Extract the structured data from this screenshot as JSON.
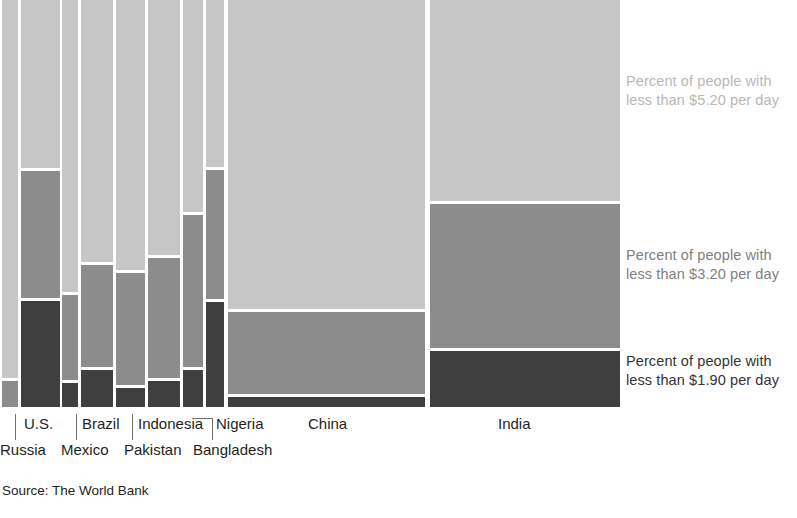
{
  "figure": {
    "source_note": "Source: The World Bank",
    "background_color": "#ffffff"
  },
  "legend": {
    "position": "right",
    "entries": [
      {
        "key": "under_5_20",
        "color": "#c6c6c6",
        "text_color": "#b8b8b8",
        "line1": "Percent of people with",
        "line2": "less than $5.20 per day"
      },
      {
        "key": "under_3_20",
        "color": "#8c8c8c",
        "text_color": "#808080",
        "line1": "Percent of people with",
        "line2": "less than $3.20 per day"
      },
      {
        "key": "under_1_90",
        "color": "#3f3f3f",
        "text_color": "#333333",
        "line1": "Percent of people with",
        "line2": "less than $1.90 per day"
      }
    ]
  },
  "chart_data": {
    "type": "bar",
    "subtype": "marimekko-mosaic",
    "title": "",
    "subtitle": "",
    "xlabel": "",
    "ylabel": "",
    "grid": false,
    "legend_position": "right",
    "note": "Column width is proportional to population; stacked segment heights are cumulative percent of population below each poverty line.",
    "categories": [
      "Russia",
      "U.S.",
      "Mexico",
      "Brazil",
      "Pakistan",
      "Indonesia",
      "Bangladesh",
      "Nigeria",
      "China",
      "India"
    ],
    "series": [
      {
        "name": "Percent of people with less than $5.20 per day",
        "color": "#c6c6c6",
        "values": [
          100,
          100,
          100,
          100,
          100,
          100,
          100,
          100,
          100,
          100
        ]
      },
      {
        "name": "Percent of people with less than $3.20 per day",
        "color": "#8c8c8c",
        "values": [
          7,
          58,
          28,
          35,
          34,
          37,
          48,
          58,
          25,
          50
        ]
      },
      {
        "name": "Percent of people with less than $1.90 per day",
        "color": "#3f3f3f",
        "values": [
          0,
          26,
          6,
          9,
          5,
          7,
          9,
          26,
          2,
          14
        ]
      }
    ],
    "columns": [
      {
        "label": "Russia",
        "label_row": "bottom",
        "x": 2,
        "width": 16,
        "segments": [
          {
            "key": "under_5_20",
            "top": 0,
            "height": 378,
            "color": "#c6c6c6"
          },
          {
            "key": "under_3_20",
            "top": 381,
            "height": 26,
            "color": "#8c8c8c"
          }
        ]
      },
      {
        "label": "U.S.",
        "label_row": "top",
        "x": 21,
        "width": 39,
        "segments": [
          {
            "key": "under_5_20",
            "top": 0,
            "height": 168,
            "color": "#c6c6c6"
          },
          {
            "key": "under_3_20",
            "top": 171,
            "height": 127,
            "color": "#8c8c8c"
          },
          {
            "key": "under_1_90",
            "top": 301,
            "height": 106,
            "color": "#3f3f3f"
          }
        ]
      },
      {
        "label": "Mexico",
        "label_row": "bottom",
        "x": 62,
        "width": 16,
        "segments": [
          {
            "key": "under_5_20",
            "top": 0,
            "height": 292,
            "color": "#c6c6c6"
          },
          {
            "key": "under_3_20",
            "top": 295,
            "height": 85,
            "color": "#8c8c8c"
          },
          {
            "key": "under_1_90",
            "top": 383,
            "height": 24,
            "color": "#3f3f3f"
          }
        ]
      },
      {
        "label": "Brazil",
        "label_row": "top",
        "x": 81,
        "width": 32,
        "segments": [
          {
            "key": "under_5_20",
            "top": 0,
            "height": 262,
            "color": "#c6c6c6"
          },
          {
            "key": "under_3_20",
            "top": 265,
            "height": 102,
            "color": "#8c8c8c"
          },
          {
            "key": "under_1_90",
            "top": 370,
            "height": 37,
            "color": "#3f3f3f"
          }
        ]
      },
      {
        "label": "Pakistan",
        "label_row": "bottom",
        "x": 116,
        "width": 29,
        "segments": [
          {
            "key": "under_5_20",
            "top": 0,
            "height": 270,
            "color": "#c6c6c6"
          },
          {
            "key": "under_3_20",
            "top": 273,
            "height": 112,
            "color": "#8c8c8c"
          },
          {
            "key": "under_1_90",
            "top": 388,
            "height": 19,
            "color": "#3f3f3f"
          }
        ]
      },
      {
        "label": "Indonesia",
        "label_row": "top",
        "x": 148,
        "width": 32,
        "segments": [
          {
            "key": "under_5_20",
            "top": 0,
            "height": 255,
            "color": "#c6c6c6"
          },
          {
            "key": "under_3_20",
            "top": 258,
            "height": 120,
            "color": "#8c8c8c"
          },
          {
            "key": "under_1_90",
            "top": 381,
            "height": 26,
            "color": "#3f3f3f"
          }
        ]
      },
      {
        "label": "Bangladesh",
        "label_row": "bottom",
        "x": 183,
        "width": 20,
        "segments": [
          {
            "key": "under_5_20",
            "top": 0,
            "height": 212,
            "color": "#c6c6c6"
          },
          {
            "key": "under_3_20",
            "top": 215,
            "height": 152,
            "color": "#8c8c8c"
          },
          {
            "key": "under_1_90",
            "top": 370,
            "height": 37,
            "color": "#3f3f3f"
          }
        ]
      },
      {
        "label": "Nigeria",
        "label_row": "top",
        "x": 206,
        "width": 18,
        "segments": [
          {
            "key": "under_5_20",
            "top": 0,
            "height": 167,
            "color": "#c6c6c6"
          },
          {
            "key": "under_3_20",
            "top": 170,
            "height": 129,
            "color": "#8c8c8c"
          },
          {
            "key": "under_1_90",
            "top": 302,
            "height": 105,
            "color": "#3f3f3f"
          }
        ]
      },
      {
        "label": "China",
        "label_row": "top",
        "x": 228,
        "width": 197,
        "segments": [
          {
            "key": "under_5_20",
            "top": 0,
            "height": 309,
            "color": "#c6c6c6"
          },
          {
            "key": "under_3_20",
            "top": 312,
            "height": 82,
            "color": "#8c8c8c"
          },
          {
            "key": "under_1_90",
            "top": 397,
            "height": 10,
            "color": "#3f3f3f"
          }
        ]
      },
      {
        "label": "India",
        "label_row": "top",
        "x": 430,
        "width": 190,
        "segments": [
          {
            "key": "under_5_20",
            "top": 0,
            "height": 201,
            "color": "#c6c6c6"
          },
          {
            "key": "under_3_20",
            "top": 204,
            "height": 144,
            "color": "#8c8c8c"
          },
          {
            "key": "under_1_90",
            "top": 351,
            "height": 56,
            "color": "#3f3f3f"
          }
        ]
      }
    ],
    "axis_labels": {
      "top_row": [
        {
          "label": "U.S.",
          "x": 24
        },
        {
          "label": "Brazil",
          "x": 82
        },
        {
          "label": "Indonesia",
          "x": 138
        },
        {
          "label": "Nigeria",
          "x": 216
        },
        {
          "label": "China",
          "x": 308
        },
        {
          "label": "India",
          "x": 498
        }
      ],
      "bottom_row": [
        {
          "label": "Russia",
          "x": 0
        },
        {
          "label": "Mexico",
          "x": 61
        },
        {
          "label": "Pakistan",
          "x": 124
        },
        {
          "label": "Bangladesh",
          "x": 193
        }
      ]
    },
    "leaders": [
      {
        "type": "vertical",
        "x": 15,
        "y": 414,
        "length": 26
      },
      {
        "type": "vertical",
        "x": 76,
        "y": 414,
        "length": 26
      },
      {
        "type": "vertical",
        "x": 132,
        "y": 414,
        "length": 26
      },
      {
        "type": "vertical",
        "x": 212,
        "y": 418,
        "length": 22
      },
      {
        "type": "horizontal",
        "x": 193,
        "y": 418,
        "length": 20
      }
    ]
  }
}
